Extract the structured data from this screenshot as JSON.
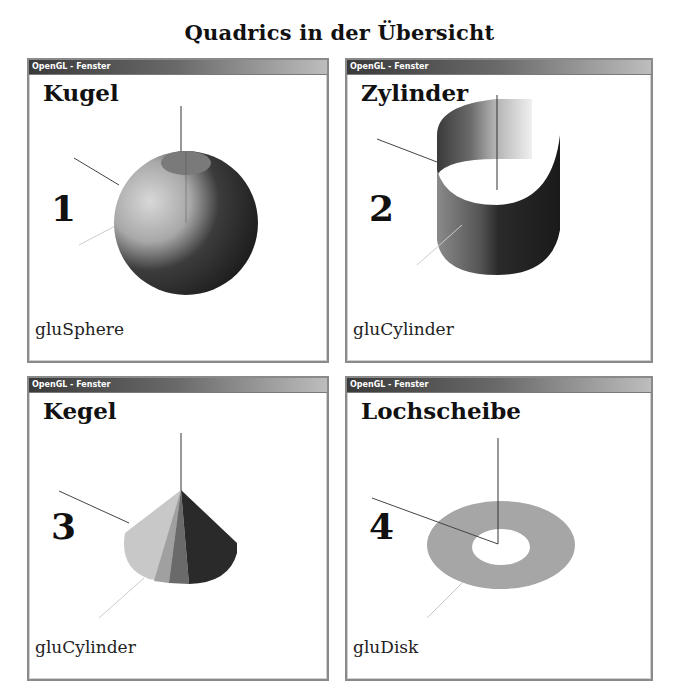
{
  "page": {
    "title": "Quadrics in der Übersicht"
  },
  "windows": [
    {
      "title": "OpenGL - Fenster",
      "heading": "Kugel",
      "number": "1",
      "function": "gluSphere",
      "shape": "sphere"
    },
    {
      "title": "OpenGL - Fenster",
      "heading": "Zylinder",
      "number": "2",
      "function": "gluCylinder",
      "shape": "cylinder"
    },
    {
      "title": "OpenGL - Fenster",
      "heading": "Kegel",
      "number": "3",
      "function": "gluCylinder",
      "shape": "cone"
    },
    {
      "title": "OpenGL - Fenster",
      "heading": "Lochscheibe",
      "number": "4",
      "function": "gluDisk",
      "shape": "disk"
    }
  ]
}
